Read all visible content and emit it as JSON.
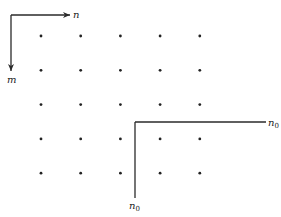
{
  "diagram": {
    "type": "lattice-grid-with-index-axes",
    "axes": {
      "horizontal_label": "n",
      "vertical_label": "m"
    },
    "grid": {
      "rows": 5,
      "cols": 5
    },
    "shifted_frame": {
      "horizontal_label": "n",
      "horizontal_subscript": "0",
      "vertical_label": "n",
      "vertical_subscript": "0"
    },
    "colors": {
      "ink": "#222222",
      "background": "#ffffff"
    }
  }
}
